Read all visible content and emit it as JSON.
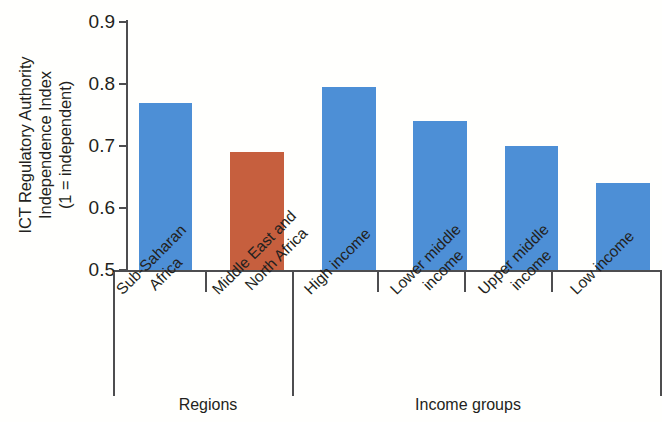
{
  "chart_data": {
    "type": "bar",
    "title": "",
    "xlabel": "",
    "ylabel": "ICT Regulatory Authority Independence Index (1 = independent)",
    "ylim": [
      0.5,
      0.9
    ],
    "yticks": [
      "0.5",
      "0.6",
      "0.7",
      "0.8",
      "0.9"
    ],
    "grid": false,
    "legend": "none",
    "categories": [
      "Sub-Saharan Africa",
      "Middle East and North Africa",
      "High income",
      "Lower middle income",
      "Upper middle income",
      "Low income"
    ],
    "values": [
      0.77,
      0.69,
      0.795,
      0.74,
      0.7,
      0.64
    ],
    "group_labels": [
      "Regions",
      "Income groups"
    ],
    "groups": [
      {
        "name": "Regions",
        "categories": [
          "Sub-Saharan Africa",
          "Middle East and North Africa"
        ]
      },
      {
        "name": "Income groups",
        "categories": [
          "High income",
          "Lower middle income",
          "Upper middle income",
          "Low income"
        ]
      }
    ],
    "bar_colors": [
      "#4d8fd6",
      "#c65f3e",
      "#4d8fd6",
      "#4d8fd6",
      "#4d8fd6",
      "#4d8fd6"
    ]
  },
  "axis": {
    "y_title_line1": "ICT Regulatory Authority",
    "y_title_line2": "Independence Index",
    "y_title_line3": "(1 = independent)",
    "ticks": [
      {
        "label": "0.9",
        "value": 0.9
      },
      {
        "label": "0.8",
        "value": 0.8
      },
      {
        "label": "0.7",
        "value": 0.7
      },
      {
        "label": "0.6",
        "value": 0.6
      },
      {
        "label": "0.5",
        "value": 0.5
      }
    ]
  },
  "categories_display": [
    {
      "line1": "Sub-Saharan",
      "line2": "Africa"
    },
    {
      "line1": "Middle East and",
      "line2": "North Africa"
    },
    {
      "line1": "High income",
      "line2": ""
    },
    {
      "line1": "Lower middle",
      "line2": "income"
    },
    {
      "line1": "Upper middle",
      "line2": "income"
    },
    {
      "line1": "Low income",
      "line2": ""
    }
  ],
  "group_titles": [
    {
      "label": "Regions"
    },
    {
      "label": "Income groups"
    }
  ],
  "colors": {
    "bar_blue": "#4d8fd6",
    "bar_orange": "#c65f3e",
    "axis": "#4d4d4f",
    "text": "#231f20"
  }
}
